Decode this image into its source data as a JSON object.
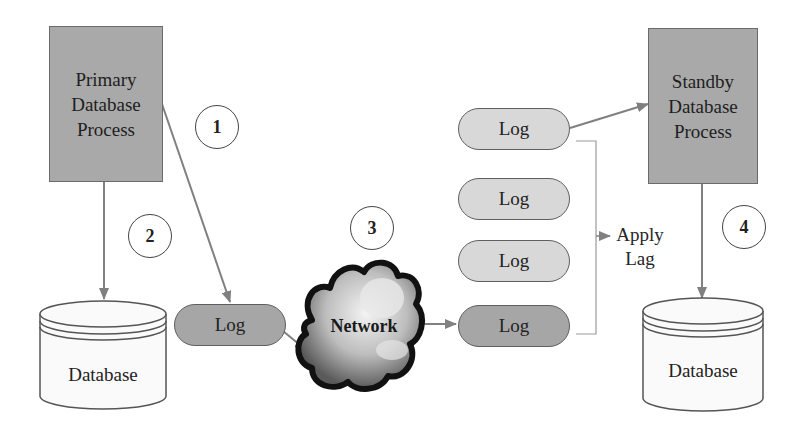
{
  "diagram": {
    "primary_process": {
      "label": "Primary\nDatabase\nProcess"
    },
    "standby_process": {
      "label": "Standby\nDatabase\nProcess"
    },
    "primary_database": {
      "label": "Database"
    },
    "standby_database": {
      "label": "Database"
    },
    "network": {
      "label": "Network"
    },
    "primary_log": {
      "label": "Log"
    },
    "standby_logs": [
      {
        "label": "Log",
        "shade": "light"
      },
      {
        "label": "Log",
        "shade": "light"
      },
      {
        "label": "Log",
        "shade": "light"
      },
      {
        "label": "Log",
        "shade": "dark"
      }
    ],
    "apply_lag": {
      "label": "Apply\nLag"
    },
    "steps": [
      {
        "number": "1"
      },
      {
        "number": "2"
      },
      {
        "number": "3"
      },
      {
        "number": "4"
      }
    ],
    "colors": {
      "process_fill": "#a9a9a9",
      "dark_log_fill": "#a6a6a6",
      "light_log_fill": "#d8d8d8",
      "arrow": "#808080"
    }
  }
}
